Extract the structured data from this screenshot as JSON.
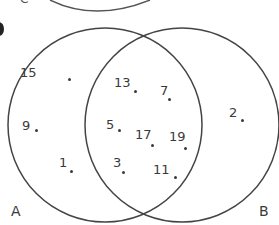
{
  "diagram": {
    "type": "venn",
    "top_fragment_label": "C",
    "sets": [
      {
        "name": "A",
        "label": "A",
        "cx": 105,
        "cy": 125,
        "r": 97
      },
      {
        "name": "B",
        "label": "B",
        "cx": 182,
        "cy": 125,
        "r": 97
      }
    ],
    "elements": [
      {
        "value": "15",
        "region": "A only",
        "lx": 20,
        "ly": 66,
        "dx": 69,
        "dy": 79
      },
      {
        "value": "9",
        "region": "A only",
        "lx": 22,
        "ly": 119,
        "dx": 36,
        "dy": 130
      },
      {
        "value": "1",
        "region": "A only",
        "lx": 59,
        "ly": 156,
        "dx": 71,
        "dy": 171
      },
      {
        "value": "13",
        "region": "A and B",
        "lx": 114,
        "ly": 76,
        "dx": 135,
        "dy": 91
      },
      {
        "value": "7",
        "region": "A and B",
        "lx": 160,
        "ly": 84,
        "dx": 169,
        "dy": 99
      },
      {
        "value": "5",
        "region": "A and B",
        "lx": 106,
        "ly": 118,
        "dx": 119,
        "dy": 130
      },
      {
        "value": "17",
        "region": "A and B",
        "lx": 135,
        "ly": 128,
        "dx": 152,
        "dy": 145
      },
      {
        "value": "19",
        "region": "A and B",
        "lx": 169,
        "ly": 130,
        "dx": 185,
        "dy": 148
      },
      {
        "value": "3",
        "region": "A and B",
        "lx": 113,
        "ly": 156,
        "dx": 123,
        "dy": 172
      },
      {
        "value": "11",
        "region": "A and B",
        "lx": 153,
        "ly": 163,
        "dx": 175,
        "dy": 177
      },
      {
        "value": "2",
        "region": "B only",
        "lx": 229,
        "ly": 106,
        "dx": 242,
        "dy": 120
      }
    ]
  },
  "colors": {
    "stroke": "#444444",
    "text": "#3a3a3a"
  }
}
